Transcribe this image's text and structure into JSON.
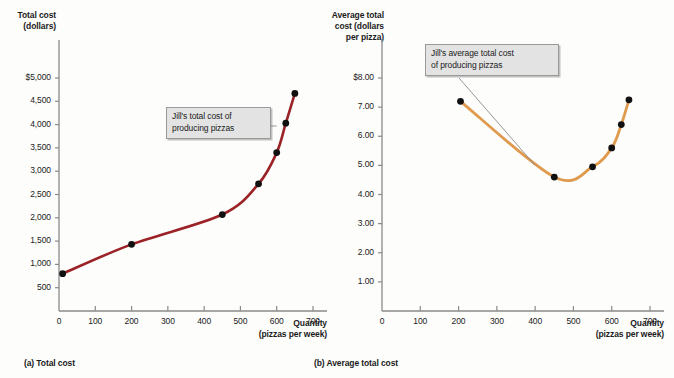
{
  "figure": {
    "panels": [
      {
        "id": "a",
        "caption": "(a) Total cost",
        "y_axis_title_line1": "Total cost",
        "y_axis_title_line2": "(dollars)",
        "x_axis_title_line1": "Quantity",
        "x_axis_title_line2": "(pizzas per week)",
        "callout_line1": "Jill's total cost of",
        "callout_line2": "producing pizzas",
        "curve_color": "#9B2226",
        "point_color": "#111111"
      },
      {
        "id": "b",
        "caption": "(b) Average total cost",
        "y_axis_title_line1": "Average total",
        "y_axis_title_line2": "cost (dollars",
        "y_axis_title_line3": "per pizza)",
        "x_axis_title_line1": "Quantity",
        "x_axis_title_line2": "(pizzas per week)",
        "callout_line1": "Jill's average total cost",
        "callout_line2": "of producing pizzas",
        "curve_color": "#E09A4E",
        "point_color": "#111111"
      }
    ]
  },
  "chart_data": [
    {
      "type": "line",
      "panel": "a",
      "title": "(a) Total cost",
      "xlabel": "Quantity (pizzas per week)",
      "ylabel": "Total cost (dollars)",
      "xlim": [
        0,
        700
      ],
      "ylim": [
        0,
        5000
      ],
      "xticks": [
        0,
        100,
        200,
        300,
        400,
        500,
        600,
        700
      ],
      "xticklabels": [
        "0",
        "100",
        "200",
        "300",
        "400",
        "500",
        "600",
        "700"
      ],
      "yticks": [
        500,
        1000,
        1500,
        2000,
        2500,
        3000,
        3500,
        4000,
        4500,
        5000
      ],
      "yticklabels": [
        "500",
        "1,000",
        "1,500",
        "2,000",
        "2,500",
        "3,000",
        "3,500",
        "4,000",
        "4,500",
        "$5,000"
      ],
      "grid": false,
      "legend": "none",
      "series": [
        {
          "name": "Jill's total cost of producing pizzas",
          "color": "#9B2226",
          "x": [
            10,
            200,
            450,
            550,
            600,
            625,
            650
          ],
          "y": [
            800,
            1430,
            2070,
            2730,
            3400,
            4030,
            4670
          ]
        }
      ],
      "annotations": [
        {
          "text": "Jill's total cost of producing pizzas",
          "points_to_x": 600,
          "points_to_y": 3400
        }
      ]
    },
    {
      "type": "line",
      "panel": "b",
      "title": "(b) Average total cost",
      "xlabel": "Quantity (pizzas per week)",
      "ylabel": "Average total cost (dollars per pizza)",
      "xlim": [
        0,
        700
      ],
      "ylim": [
        0,
        8
      ],
      "xticks": [
        0,
        100,
        200,
        300,
        400,
        500,
        600,
        700
      ],
      "xticklabels": [
        "0",
        "100",
        "200",
        "300",
        "400",
        "500",
        "600",
        "700"
      ],
      "yticks": [
        1,
        2,
        3,
        4,
        5,
        6,
        7,
        8
      ],
      "yticklabels": [
        "1.00",
        "2.00",
        "3.00",
        "4.00",
        "5.00",
        "6.00",
        "7.00",
        "$8.00"
      ],
      "grid": false,
      "legend": "none",
      "series": [
        {
          "name": "Jill's average total cost of producing pizzas",
          "color": "#E09A4E",
          "x": [
            205,
            450,
            550,
            600,
            625,
            645
          ],
          "y": [
            7.2,
            4.6,
            4.95,
            5.6,
            6.4,
            7.25
          ]
        }
      ],
      "annotations": [
        {
          "text": "Jill's average total cost of producing pizzas",
          "points_to_x": 400,
          "points_to_y": 5.0
        }
      ]
    }
  ]
}
